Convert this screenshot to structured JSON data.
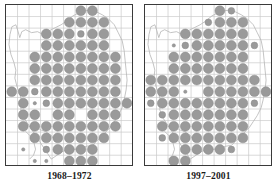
{
  "figure": {
    "type": "distribution-atlas-map-pair",
    "background_color": "#ffffff"
  },
  "style": {
    "grid_color": "#c9c9c9",
    "coast_color": "#b0b0b0",
    "frame_color": "#3a3a3a",
    "dot_fill": "#9a9a9a",
    "dot_stroke": "#8a8a8a",
    "caption_color": "#1a1a1a",
    "grid_cell_px": 11.7,
    "dot_radius_large": 5.0,
    "dot_radius_medium": 3.4,
    "dot_radius_small": 1.7
  },
  "panels": [
    {
      "id": "panel-left",
      "caption": "1968–1972",
      "grid": {
        "cols": 11,
        "rows": 14
      },
      "dots": [
        {
          "c": 6,
          "r": 0,
          "s": "large"
        },
        {
          "c": 7,
          "r": 0,
          "s": "large"
        },
        {
          "c": 5,
          "r": 1,
          "s": "large"
        },
        {
          "c": 6,
          "r": 1,
          "s": "large"
        },
        {
          "c": 7,
          "r": 1,
          "s": "large"
        },
        {
          "c": 8,
          "r": 1,
          "s": "large"
        },
        {
          "c": 3,
          "r": 2,
          "s": "large"
        },
        {
          "c": 4,
          "r": 2,
          "s": "large"
        },
        {
          "c": 5,
          "r": 2,
          "s": "large"
        },
        {
          "c": 6,
          "r": 2,
          "s": "medium"
        },
        {
          "c": 7,
          "r": 2,
          "s": "large"
        },
        {
          "c": 8,
          "r": 2,
          "s": "large"
        },
        {
          "c": 3,
          "r": 3,
          "s": "large"
        },
        {
          "c": 4,
          "r": 3,
          "s": "large"
        },
        {
          "c": 5,
          "r": 3,
          "s": "large"
        },
        {
          "c": 6,
          "r": 3,
          "s": "large"
        },
        {
          "c": 7,
          "r": 3,
          "s": "large"
        },
        {
          "c": 8,
          "r": 3,
          "s": "large"
        },
        {
          "c": 2,
          "r": 4,
          "s": "large"
        },
        {
          "c": 3,
          "r": 4,
          "s": "large"
        },
        {
          "c": 4,
          "r": 4,
          "s": "large"
        },
        {
          "c": 5,
          "r": 4,
          "s": "large"
        },
        {
          "c": 6,
          "r": 4,
          "s": "large"
        },
        {
          "c": 7,
          "r": 4,
          "s": "large"
        },
        {
          "c": 8,
          "r": 4,
          "s": "large"
        },
        {
          "c": 9,
          "r": 4,
          "s": "large"
        },
        {
          "c": 2,
          "r": 5,
          "s": "large"
        },
        {
          "c": 3,
          "r": 5,
          "s": "large"
        },
        {
          "c": 4,
          "r": 5,
          "s": "large"
        },
        {
          "c": 5,
          "r": 5,
          "s": "large"
        },
        {
          "c": 6,
          "r": 5,
          "s": "large"
        },
        {
          "c": 7,
          "r": 5,
          "s": "large"
        },
        {
          "c": 8,
          "r": 5,
          "s": "large"
        },
        {
          "c": 9,
          "r": 5,
          "s": "large"
        },
        {
          "c": 2,
          "r": 6,
          "s": "large"
        },
        {
          "c": 3,
          "r": 6,
          "s": "large"
        },
        {
          "c": 4,
          "r": 6,
          "s": "large"
        },
        {
          "c": 5,
          "r": 6,
          "s": "large"
        },
        {
          "c": 6,
          "r": 6,
          "s": "large"
        },
        {
          "c": 7,
          "r": 6,
          "s": "large"
        },
        {
          "c": 8,
          "r": 6,
          "s": "large"
        },
        {
          "c": 9,
          "r": 6,
          "s": "large"
        },
        {
          "c": 0,
          "r": 7,
          "s": "large"
        },
        {
          "c": 1,
          "r": 7,
          "s": "large"
        },
        {
          "c": 2,
          "r": 7,
          "s": "medium"
        },
        {
          "c": 3,
          "r": 7,
          "s": "large"
        },
        {
          "c": 4,
          "r": 7,
          "s": "large"
        },
        {
          "c": 5,
          "r": 7,
          "s": "large"
        },
        {
          "c": 6,
          "r": 7,
          "s": "large"
        },
        {
          "c": 7,
          "r": 7,
          "s": "large"
        },
        {
          "c": 8,
          "r": 7,
          "s": "large"
        },
        {
          "c": 9,
          "r": 7,
          "s": "large"
        },
        {
          "c": 1,
          "r": 8,
          "s": "large"
        },
        {
          "c": 2,
          "r": 8,
          "s": "small"
        },
        {
          "c": 3,
          "r": 8,
          "s": "medium"
        },
        {
          "c": 4,
          "r": 8,
          "s": "large"
        },
        {
          "c": 5,
          "r": 8,
          "s": "large"
        },
        {
          "c": 6,
          "r": 8,
          "s": "large"
        },
        {
          "c": 7,
          "r": 8,
          "s": "large"
        },
        {
          "c": 8,
          "r": 8,
          "s": "large"
        },
        {
          "c": 9,
          "r": 8,
          "s": "large"
        },
        {
          "c": 10,
          "r": 8,
          "s": "large"
        },
        {
          "c": 1,
          "r": 9,
          "s": "large"
        },
        {
          "c": 2,
          "r": 9,
          "s": "large"
        },
        {
          "c": 4,
          "r": 9,
          "s": "large"
        },
        {
          "c": 5,
          "r": 9,
          "s": "large"
        },
        {
          "c": 7,
          "r": 9,
          "s": "large"
        },
        {
          "c": 8,
          "r": 9,
          "s": "large"
        },
        {
          "c": 9,
          "r": 9,
          "s": "large"
        },
        {
          "c": 1,
          "r": 10,
          "s": "large"
        },
        {
          "c": 2,
          "r": 10,
          "s": "large"
        },
        {
          "c": 3,
          "r": 10,
          "s": "large"
        },
        {
          "c": 4,
          "r": 10,
          "s": "large"
        },
        {
          "c": 5,
          "r": 10,
          "s": "large"
        },
        {
          "c": 6,
          "r": 10,
          "s": "large"
        },
        {
          "c": 7,
          "r": 10,
          "s": "large"
        },
        {
          "c": 8,
          "r": 10,
          "s": "large"
        },
        {
          "c": 9,
          "r": 10,
          "s": "large"
        },
        {
          "c": 2,
          "r": 11,
          "s": "large"
        },
        {
          "c": 3,
          "r": 11,
          "s": "large"
        },
        {
          "c": 4,
          "r": 11,
          "s": "large"
        },
        {
          "c": 5,
          "r": 11,
          "s": "large"
        },
        {
          "c": 6,
          "r": 11,
          "s": "large"
        },
        {
          "c": 7,
          "r": 11,
          "s": "large"
        },
        {
          "c": 8,
          "r": 11,
          "s": "large"
        },
        {
          "c": 1,
          "r": 12,
          "s": "small"
        },
        {
          "c": 3,
          "r": 12,
          "s": "medium"
        },
        {
          "c": 4,
          "r": 12,
          "s": "large"
        },
        {
          "c": 5,
          "r": 12,
          "s": "large"
        },
        {
          "c": 6,
          "r": 12,
          "s": "large"
        },
        {
          "c": 7,
          "r": 12,
          "s": "large"
        },
        {
          "c": 2,
          "r": 13,
          "s": "small"
        },
        {
          "c": 3,
          "r": 13,
          "s": "small"
        },
        {
          "c": 5,
          "r": 13,
          "s": "large"
        },
        {
          "c": 6,
          "r": 13,
          "s": "large"
        },
        {
          "c": 7,
          "r": 13,
          "s": "large"
        }
      ]
    },
    {
      "id": "panel-right",
      "caption": "1997–2001",
      "grid": {
        "cols": 11,
        "rows": 14
      },
      "dots": [
        {
          "c": 6,
          "r": 0,
          "s": "large"
        },
        {
          "c": 7,
          "r": 0,
          "s": "medium"
        },
        {
          "c": 5,
          "r": 1,
          "s": "medium"
        },
        {
          "c": 6,
          "r": 1,
          "s": "large"
        },
        {
          "c": 7,
          "r": 1,
          "s": "large"
        },
        {
          "c": 8,
          "r": 1,
          "s": "large"
        },
        {
          "c": 3,
          "r": 2,
          "s": "large"
        },
        {
          "c": 4,
          "r": 2,
          "s": "large"
        },
        {
          "c": 5,
          "r": 2,
          "s": "large"
        },
        {
          "c": 6,
          "r": 2,
          "s": "large"
        },
        {
          "c": 7,
          "r": 2,
          "s": "large"
        },
        {
          "c": 8,
          "r": 2,
          "s": "large"
        },
        {
          "c": 2,
          "r": 3,
          "s": "small"
        },
        {
          "c": 3,
          "r": 3,
          "s": "medium"
        },
        {
          "c": 4,
          "r": 3,
          "s": "large"
        },
        {
          "c": 5,
          "r": 3,
          "s": "large"
        },
        {
          "c": 6,
          "r": 3,
          "s": "large"
        },
        {
          "c": 7,
          "r": 3,
          "s": "large"
        },
        {
          "c": 8,
          "r": 3,
          "s": "large"
        },
        {
          "c": 9,
          "r": 3,
          "s": "medium"
        },
        {
          "c": 2,
          "r": 4,
          "s": "large"
        },
        {
          "c": 3,
          "r": 4,
          "s": "large"
        },
        {
          "c": 4,
          "r": 4,
          "s": "large"
        },
        {
          "c": 5,
          "r": 4,
          "s": "large"
        },
        {
          "c": 6,
          "r": 4,
          "s": "large"
        },
        {
          "c": 7,
          "r": 4,
          "s": "large"
        },
        {
          "c": 8,
          "r": 4,
          "s": "large"
        },
        {
          "c": 2,
          "r": 5,
          "s": "large"
        },
        {
          "c": 3,
          "r": 5,
          "s": "large"
        },
        {
          "c": 4,
          "r": 5,
          "s": "large"
        },
        {
          "c": 5,
          "r": 5,
          "s": "large"
        },
        {
          "c": 6,
          "r": 5,
          "s": "large"
        },
        {
          "c": 7,
          "r": 5,
          "s": "large"
        },
        {
          "c": 8,
          "r": 5,
          "s": "large"
        },
        {
          "c": 0,
          "r": 6,
          "s": "large"
        },
        {
          "c": 1,
          "r": 6,
          "s": "large"
        },
        {
          "c": 2,
          "r": 6,
          "s": "large"
        },
        {
          "c": 3,
          "r": 6,
          "s": "large"
        },
        {
          "c": 4,
          "r": 6,
          "s": "large"
        },
        {
          "c": 5,
          "r": 6,
          "s": "large"
        },
        {
          "c": 6,
          "r": 6,
          "s": "large"
        },
        {
          "c": 7,
          "r": 6,
          "s": "large"
        },
        {
          "c": 8,
          "r": 6,
          "s": "large"
        },
        {
          "c": 9,
          "r": 6,
          "s": "large"
        },
        {
          "c": 0,
          "r": 7,
          "s": "large"
        },
        {
          "c": 1,
          "r": 7,
          "s": "large"
        },
        {
          "c": 2,
          "r": 7,
          "s": "large"
        },
        {
          "c": 3,
          "r": 7,
          "s": "small"
        },
        {
          "c": 5,
          "r": 7,
          "s": "large"
        },
        {
          "c": 6,
          "r": 7,
          "s": "large"
        },
        {
          "c": 7,
          "r": 7,
          "s": "large"
        },
        {
          "c": 8,
          "r": 7,
          "s": "large"
        },
        {
          "c": 9,
          "r": 7,
          "s": "large"
        },
        {
          "c": 10,
          "r": 7,
          "s": "large"
        },
        {
          "c": 0,
          "r": 8,
          "s": "medium"
        },
        {
          "c": 1,
          "r": 8,
          "s": "large"
        },
        {
          "c": 2,
          "r": 8,
          "s": "large"
        },
        {
          "c": 3,
          "r": 8,
          "s": "large"
        },
        {
          "c": 4,
          "r": 8,
          "s": "large"
        },
        {
          "c": 5,
          "r": 8,
          "s": "large"
        },
        {
          "c": 6,
          "r": 8,
          "s": "large"
        },
        {
          "c": 7,
          "r": 8,
          "s": "large"
        },
        {
          "c": 8,
          "r": 8,
          "s": "large"
        },
        {
          "c": 9,
          "r": 8,
          "s": "medium"
        },
        {
          "c": 1,
          "r": 9,
          "s": "medium"
        },
        {
          "c": 2,
          "r": 9,
          "s": "large"
        },
        {
          "c": 3,
          "r": 9,
          "s": "large"
        },
        {
          "c": 4,
          "r": 9,
          "s": "large"
        },
        {
          "c": 5,
          "r": 9,
          "s": "large"
        },
        {
          "c": 6,
          "r": 9,
          "s": "large"
        },
        {
          "c": 7,
          "r": 9,
          "s": "large"
        },
        {
          "c": 8,
          "r": 9,
          "s": "large"
        },
        {
          "c": 1,
          "r": 10,
          "s": "large"
        },
        {
          "c": 2,
          "r": 10,
          "s": "large"
        },
        {
          "c": 3,
          "r": 10,
          "s": "large"
        },
        {
          "c": 4,
          "r": 10,
          "s": "large"
        },
        {
          "c": 5,
          "r": 10,
          "s": "large"
        },
        {
          "c": 6,
          "r": 10,
          "s": "large"
        },
        {
          "c": 7,
          "r": 10,
          "s": "large"
        },
        {
          "c": 8,
          "r": 10,
          "s": "large"
        },
        {
          "c": 1,
          "r": 11,
          "s": "medium"
        },
        {
          "c": 2,
          "r": 11,
          "s": "large"
        },
        {
          "c": 3,
          "r": 11,
          "s": "large"
        },
        {
          "c": 4,
          "r": 11,
          "s": "large"
        },
        {
          "c": 5,
          "r": 11,
          "s": "large"
        },
        {
          "c": 6,
          "r": 11,
          "s": "large"
        },
        {
          "c": 7,
          "r": 11,
          "s": "large"
        },
        {
          "c": 8,
          "r": 11,
          "s": "large"
        },
        {
          "c": 3,
          "r": 12,
          "s": "large"
        },
        {
          "c": 4,
          "r": 12,
          "s": "large"
        },
        {
          "c": 5,
          "r": 12,
          "s": "large"
        },
        {
          "c": 6,
          "r": 12,
          "s": "large"
        },
        {
          "c": 7,
          "r": 12,
          "s": "medium"
        },
        {
          "c": 2,
          "r": 13,
          "s": "large"
        },
        {
          "c": 3,
          "r": 13,
          "s": "large"
        }
      ]
    }
  ]
}
